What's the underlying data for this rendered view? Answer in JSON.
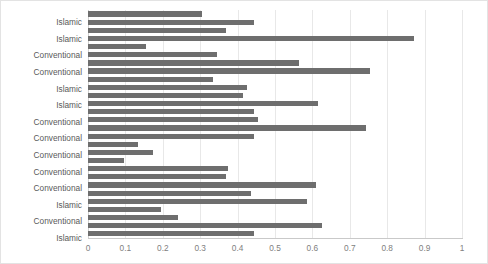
{
  "chart_data": {
    "type": "bar",
    "orientation": "horizontal",
    "title": "",
    "xlabel": "",
    "ylabel": "",
    "xlim": [
      0,
      1
    ],
    "ylim": null,
    "grid": true,
    "legend": false,
    "bar_color": "#6e6e6e",
    "xticks": [
      "0",
      "0.1",
      "0.2",
      "0.3",
      "0.4",
      "0.5",
      "0.6",
      "0.7",
      "0.8",
      "0.9",
      "1"
    ],
    "xtick_values": [
      0,
      0.1,
      0.2,
      0.3,
      0.4,
      0.5,
      0.6,
      0.7,
      0.8,
      0.9,
      1
    ],
    "categories": [
      "",
      "Islamic",
      "",
      "Islamic",
      "",
      "Conventional",
      "",
      "Conventional",
      "",
      "Islamic",
      "",
      "Islamic",
      "",
      "Conventional",
      "",
      "Conventional",
      "",
      "Conventional",
      "",
      "Conventional",
      "",
      "Conventional",
      "",
      "Islamic",
      "",
      "Conventional",
      "",
      "Islamic"
    ],
    "values": [
      0.305,
      0.445,
      0.369,
      0.872,
      0.155,
      0.345,
      0.565,
      0.755,
      0.335,
      0.425,
      0.415,
      0.615,
      0.445,
      0.455,
      0.742,
      0.445,
      0.135,
      0.175,
      0.096,
      0.375,
      0.37,
      0.61,
      0.435,
      0.585,
      0.195,
      0.24,
      0.625,
      0.445
    ]
  }
}
